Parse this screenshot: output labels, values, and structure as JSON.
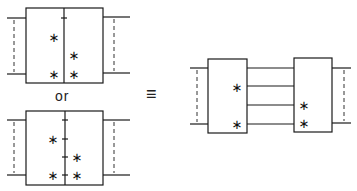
{
  "labels": {
    "or": "or",
    "equiv": "≡",
    "star": "∗"
  },
  "colors": {
    "line": "#1a1a1a",
    "background": "#ffffff"
  }
}
